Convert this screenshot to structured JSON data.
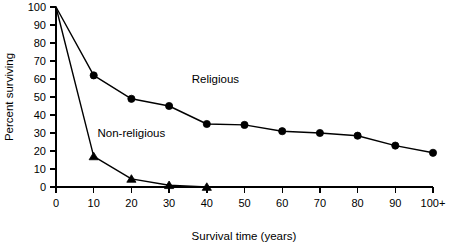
{
  "chart_data": {
    "type": "line",
    "title": "",
    "xlabel": "Survival time (years)",
    "ylabel": "Percent surviving",
    "xlim": [
      0,
      100
    ],
    "ylim": [
      0,
      100
    ],
    "grid": false,
    "legend_position": "inline-annotation",
    "x_tick_labels": [
      "0",
      "10",
      "20",
      "30",
      "40",
      "50",
      "60",
      "70",
      "80",
      "90",
      "100+"
    ],
    "x_tick_values": [
      0,
      10,
      20,
      30,
      40,
      50,
      60,
      70,
      80,
      90,
      100
    ],
    "y_tick_labels": [
      "0",
      "10",
      "20",
      "30",
      "40",
      "50",
      "60",
      "70",
      "80",
      "90",
      "100"
    ],
    "y_tick_values": [
      0,
      10,
      20,
      30,
      40,
      50,
      60,
      70,
      80,
      90,
      100
    ],
    "series": [
      {
        "name": "Religious",
        "marker": "circle",
        "x": [
          0,
          10,
          20,
          30,
          40,
          50,
          60,
          70,
          80,
          90,
          100
        ],
        "values": [
          100,
          62,
          49,
          45,
          35,
          34.5,
          31,
          30,
          28.5,
          23,
          19
        ],
        "label_x": 36,
        "label_y": 58
      },
      {
        "name": "Non-religious",
        "marker": "triangle",
        "x": [
          0,
          10,
          20,
          30,
          40
        ],
        "values": [
          100,
          17,
          4.5,
          1,
          0
        ],
        "label_x": 11,
        "label_y": 28
      }
    ],
    "annotations": [
      {
        "text": "Religious",
        "x": 36,
        "y": 58
      },
      {
        "text": "Non-religious",
        "x": 11,
        "y": 28
      }
    ]
  },
  "colors": {
    "ink": "#000000",
    "background": "#ffffff"
  }
}
